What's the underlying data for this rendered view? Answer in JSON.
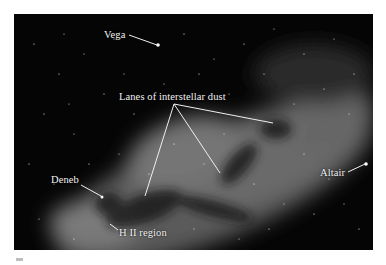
{
  "figure": {
    "labels": {
      "vega": "Vega",
      "dust": "Lanes of interstellar dust",
      "altair": "Altair",
      "deneb": "Deneb",
      "h2": "H II region"
    },
    "colors": {
      "background": "#ffffff",
      "sky": "#050505",
      "label": "#f2f2f2",
      "pointer": "#f0f0f0"
    }
  }
}
